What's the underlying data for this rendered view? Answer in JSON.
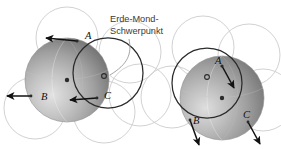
{
  "figure": {
    "title_annotation": {
      "line1": "Erde-Mond-",
      "line2": "Schwerpunkt"
    },
    "colors": {
      "background": "#ffffff",
      "annotation_text": "#3a3a3a",
      "point_label": "#111111",
      "sphere_dark": "#6e6e6e",
      "sphere_mid": "#9a9a9a",
      "sphere_light": "#d8d8d8",
      "orbit_circle_stroke": "#c9c9c9",
      "main_circle_stroke": "#2b2b2b",
      "arrow_stroke": "#111111",
      "center_dot": "#2b2b2b"
    },
    "panels": [
      {
        "id": "left-panel",
        "name": "earth-moon-barycenter-panel-left",
        "sphere": {
          "cx": 67,
          "cy": 80,
          "r": 42
        },
        "inner_circle": {
          "cx": 108,
          "cy": 73,
          "r": 35
        },
        "orbit_circles": [
          {
            "cx": 67,
            "cy": 38,
            "r": 31
          },
          {
            "cx": 35,
            "cy": 108,
            "r": 31
          },
          {
            "cx": 104,
            "cy": 112,
            "r": 31
          },
          {
            "cx": 130,
            "cy": 52,
            "r": 31
          },
          {
            "cx": 140,
            "cy": 95,
            "r": 31
          }
        ],
        "center_dot": {
          "cx": 67,
          "cy": 80
        },
        "barycenter_dot": {
          "cx": 104,
          "cy": 76
        },
        "points": [
          {
            "label": "A",
            "x": 77,
            "y": 40,
            "lx": 85,
            "ly": 37
          },
          {
            "label": "B",
            "x": 30,
            "y": 96,
            "lx": 41,
            "ly": 99
          },
          {
            "label": "C",
            "x": 97,
            "y": 99,
            "lx": 104,
            "ly": 98
          }
        ],
        "arrows": [
          {
            "name": "arrow-a",
            "x1": 77,
            "y1": 41,
            "x2": 43,
            "y2": 38
          },
          {
            "name": "arrow-b",
            "x1": 31,
            "y1": 96,
            "x2": 4,
            "y2": 96
          },
          {
            "name": "arrow-c",
            "x1": 95,
            "y1": 98,
            "x2": 67,
            "y2": 100
          }
        ]
      },
      {
        "id": "right-panel",
        "name": "earth-moon-barycenter-panel-right",
        "sphere": {
          "cx": 222,
          "cy": 98,
          "r": 42
        },
        "inner_circle": {
          "cx": 207,
          "cy": 83,
          "r": 35
        },
        "orbit_circles": [
          {
            "cx": 203,
            "cy": 47,
            "r": 31
          },
          {
            "cx": 172,
            "cy": 97,
            "r": 31
          },
          {
            "cx": 249,
            "cy": 55,
            "r": 31
          },
          {
            "cx": 263,
            "cy": 100,
            "r": 31
          }
        ],
        "center_dot": {
          "cx": 207,
          "cy": 77
        },
        "barycenter_dot": {
          "cx": 222,
          "cy": 98
        },
        "points": [
          {
            "label": "A",
            "x": 228,
            "y": 70,
            "lx": 219,
            "ly": 64
          },
          {
            "label": "B",
            "x": 196,
            "y": 126,
            "lx": 196,
            "ly": 122
          },
          {
            "label": "C",
            "x": 248,
            "y": 118,
            "lx": 243,
            "ly": 117
          }
        ],
        "arrows": [
          {
            "name": "arrow-a",
            "x1": 222,
            "y1": 66,
            "x2": 236,
            "y2": 91
          },
          {
            "name": "arrow-b",
            "x1": 190,
            "y1": 120,
            "x2": 200,
            "y2": 147
          },
          {
            "name": "arrow-c",
            "x1": 248,
            "y1": 122,
            "x2": 262,
            "y2": 146
          }
        ]
      }
    ],
    "leader_line": {
      "name": "annotation-leader-line",
      "path": "M 129 36 C 131 52, 127 62, 110 74"
    }
  }
}
